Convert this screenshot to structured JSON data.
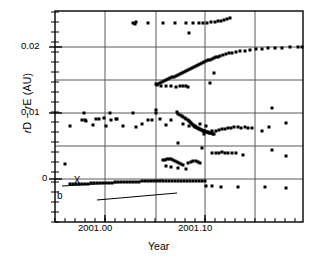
{
  "figure": {
    "type": "scatter-plot",
    "background": "#ffffff",
    "ink_color": "#000000",
    "grid_color": "#5a5a5a"
  },
  "axes": {
    "xlabel": "Year",
    "ylabel_parts": {
      "r1": "r",
      "d": "D",
      "minus": " − ",
      "r2": "r",
      "e": "E",
      "unit": " (AU)"
    },
    "ylabel_text": "rD − rE (AU)",
    "x_ticks": [
      {
        "value": 2001.0,
        "label": "2001.00",
        "px": 105
      },
      {
        "value": 2001.1,
        "label": "2001.10",
        "px": 205
      }
    ],
    "y_ticks": [
      {
        "value": 0.02,
        "label": "0.02",
        "px": 47
      },
      {
        "value": 0.01,
        "label": "0.01",
        "px": 113
      },
      {
        "value": 0.0,
        "label": "0",
        "px": 179
      }
    ],
    "x_gridlines_px": [
      105,
      156,
      205,
      255
    ],
    "y_gridlines_px": [
      47,
      80,
      113,
      146,
      179
    ],
    "minor_tick_spacing_px": 10,
    "frame_px": {
      "left": 55,
      "right": 303,
      "top": 11,
      "bottom": 222
    },
    "xlim": [
      2000.955,
      2001.203
    ],
    "ylim": [
      -0.0033,
      0.0262
    ]
  },
  "annotations": [
    {
      "name": "x-marker",
      "glyph": "X",
      "x_px": 77,
      "y_px": 180
    },
    {
      "name": "label-a",
      "text": "a",
      "x_px": 57,
      "y_px": 190
    },
    {
      "name": "label-b",
      "text": "b",
      "x_px": 99,
      "y_px": 196
    },
    {
      "name": "line-a",
      "x1_px": 62,
      "y1_px": 186,
      "x2_px": 163,
      "y2_px": 180
    },
    {
      "name": "line-b",
      "x1_px": 97,
      "y1_px": 200,
      "x2_px": 177,
      "y2_px": 193
    }
  ],
  "chart_data": {
    "type": "scatter",
    "title": "",
    "xlabel": "Year",
    "ylabel": "rD − rE (AU)",
    "xlim": [
      2000.955,
      2001.203
    ],
    "ylim": [
      -0.0033,
      0.0262
    ],
    "xticks": [
      2001.0,
      2001.1
    ],
    "xticklabels": [
      "2001.00",
      "2001.10"
    ],
    "yticks": [
      0,
      0.01,
      0.02
    ],
    "yticklabels": [
      "0",
      "0.01",
      "0.02"
    ],
    "grid": true,
    "legend": "none",
    "marker": "square",
    "marker_size_px": 3,
    "series": [
      {
        "name": "upper-track-0.0235",
        "points_px": [
          [
            133,
            23
          ],
          [
            135,
            24
          ],
          [
            136,
            22
          ],
          [
            148,
            23
          ],
          [
            163,
            23
          ],
          [
            175,
            23
          ],
          [
            186,
            23
          ],
          [
            193,
            23
          ],
          [
            199,
            23
          ],
          [
            203,
            23
          ],
          [
            207,
            23
          ],
          [
            211,
            22
          ],
          [
            215,
            22
          ],
          [
            218,
            21
          ],
          [
            221,
            21
          ],
          [
            224,
            20
          ],
          [
            227,
            19
          ],
          [
            230,
            18
          ],
          [
            189,
            33
          ]
        ]
      },
      {
        "name": "rising-track-main",
        "points_px": [
          [
            156,
            84
          ],
          [
            158,
            84
          ],
          [
            160,
            83
          ],
          [
            162,
            82
          ],
          [
            164,
            81
          ],
          [
            166,
            80
          ],
          [
            168,
            79
          ],
          [
            170,
            78
          ],
          [
            172,
            77
          ],
          [
            174,
            77
          ],
          [
            176,
            76
          ],
          [
            178,
            75
          ],
          [
            180,
            74
          ],
          [
            182,
            73
          ],
          [
            184,
            72
          ],
          [
            186,
            71
          ],
          [
            188,
            70
          ],
          [
            190,
            69
          ],
          [
            192,
            68
          ],
          [
            194,
            67
          ],
          [
            196,
            66
          ],
          [
            198,
            65
          ],
          [
            200,
            64
          ],
          [
            202,
            63
          ],
          [
            204,
            62
          ],
          [
            206,
            61
          ],
          [
            208,
            60
          ],
          [
            210,
            60
          ],
          [
            212,
            59
          ],
          [
            214,
            58
          ],
          [
            216,
            57
          ],
          [
            218,
            57
          ],
          [
            220,
            56
          ],
          [
            223,
            55
          ],
          [
            226,
            54
          ],
          [
            229,
            53
          ],
          [
            232,
            53
          ],
          [
            236,
            52
          ],
          [
            240,
            51
          ],
          [
            245,
            51
          ],
          [
            250,
            50
          ],
          [
            256,
            49
          ],
          [
            262,
            49
          ],
          [
            268,
            48
          ],
          [
            275,
            48
          ],
          [
            282,
            48
          ],
          [
            290,
            47
          ],
          [
            298,
            47
          ],
          [
            302,
            47
          ]
        ]
      },
      {
        "name": "rising-track-strays",
        "points_px": [
          [
            157,
            85
          ],
          [
            161,
            86
          ],
          [
            166,
            86
          ],
          [
            171,
            86
          ],
          [
            176,
            87
          ],
          [
            180,
            86
          ],
          [
            183,
            86
          ],
          [
            186,
            86
          ],
          [
            188,
            87
          ],
          [
            210,
            83
          ],
          [
            214,
            73
          ]
        ]
      },
      {
        "name": "mid-scatter-0.005-to-0.01",
        "points_px": [
          [
            70,
            126
          ],
          [
            84,
            113
          ],
          [
            82,
            120
          ],
          [
            85,
            120
          ],
          [
            86,
            121
          ],
          [
            93,
            125
          ],
          [
            96,
            119
          ],
          [
            99,
            119
          ],
          [
            104,
            118
          ],
          [
            106,
            126
          ],
          [
            110,
            113
          ],
          [
            111,
            120
          ],
          [
            116,
            119
          ],
          [
            117,
            119
          ],
          [
            123,
            126
          ],
          [
            133,
            113
          ],
          [
            136,
            127
          ],
          [
            142,
            124
          ],
          [
            148,
            120
          ],
          [
            152,
            120
          ],
          [
            156,
            113
          ],
          [
            156,
            110
          ],
          [
            160,
            119
          ],
          [
            166,
            125
          ],
          [
            171,
            120
          ],
          [
            177,
            112
          ],
          [
            183,
            124
          ],
          [
            189,
            126
          ],
          [
            195,
            126
          ],
          [
            200,
            124
          ],
          [
            204,
            134
          ],
          [
            206,
            126
          ],
          [
            212,
            131
          ],
          [
            216,
            131
          ],
          [
            219,
            130
          ],
          [
            222,
            129
          ],
          [
            225,
            129
          ],
          [
            228,
            128
          ],
          [
            231,
            128
          ],
          [
            234,
            127
          ],
          [
            238,
            127
          ],
          [
            241,
            128
          ],
          [
            245,
            127
          ],
          [
            248,
            128
          ],
          [
            252,
            128
          ],
          [
            272,
            108
          ],
          [
            269,
            127
          ],
          [
            262,
            131
          ],
          [
            286,
            123
          ]
        ]
      },
      {
        "name": "descending-S-track",
        "points_px": [
          [
            178,
            114
          ],
          [
            180,
            115
          ],
          [
            182,
            116
          ],
          [
            183,
            117
          ],
          [
            185,
            118
          ],
          [
            186,
            119
          ],
          [
            188,
            120
          ],
          [
            189,
            121
          ],
          [
            190,
            122
          ],
          [
            191,
            123
          ],
          [
            192,
            124
          ],
          [
            193,
            125
          ],
          [
            194,
            126
          ],
          [
            195,
            127
          ],
          [
            196,
            127
          ],
          [
            197,
            128
          ],
          [
            198,
            128
          ],
          [
            199,
            129
          ],
          [
            200,
            129
          ],
          [
            201,
            130
          ],
          [
            202,
            130
          ],
          [
            203,
            131
          ],
          [
            204,
            131
          ],
          [
            205,
            131
          ],
          [
            206,
            132
          ],
          [
            207,
            132
          ],
          [
            208,
            132
          ],
          [
            209,
            133
          ],
          [
            210,
            133
          ],
          [
            211,
            133
          ],
          [
            212,
            133
          ],
          [
            213,
            134
          ],
          [
            214,
            134
          ]
        ]
      },
      {
        "name": "low-scatter-near-0.002",
        "points_px": [
          [
            163,
            160
          ],
          [
            165,
            160
          ],
          [
            167,
            159
          ],
          [
            169,
            159
          ],
          [
            171,
            159
          ],
          [
            173,
            160
          ],
          [
            175,
            161
          ],
          [
            177,
            162
          ],
          [
            179,
            163
          ],
          [
            181,
            164
          ],
          [
            183,
            165
          ],
          [
            188,
            163
          ],
          [
            191,
            162
          ],
          [
            193,
            161
          ],
          [
            196,
            161
          ],
          [
            198,
            162
          ],
          [
            200,
            163
          ],
          [
            186,
            169
          ],
          [
            178,
            168
          ],
          [
            171,
            167
          ],
          [
            166,
            166
          ]
        ]
      },
      {
        "name": "baseline-track-near-zero",
        "points_px": [
          [
            70,
            184
          ],
          [
            73,
            184
          ],
          [
            76,
            184
          ],
          [
            79,
            184
          ],
          [
            82,
            184
          ],
          [
            85,
            184
          ],
          [
            88,
            184
          ],
          [
            91,
            183
          ],
          [
            94,
            183
          ],
          [
            97,
            183
          ],
          [
            100,
            183
          ],
          [
            103,
            183
          ],
          [
            106,
            183
          ],
          [
            109,
            183
          ],
          [
            112,
            183
          ],
          [
            115,
            182
          ],
          [
            118,
            182
          ],
          [
            121,
            182
          ],
          [
            124,
            182
          ],
          [
            127,
            182
          ],
          [
            130,
            182
          ],
          [
            133,
            182
          ],
          [
            136,
            182
          ],
          [
            139,
            182
          ],
          [
            142,
            181
          ],
          [
            145,
            181
          ],
          [
            148,
            181
          ],
          [
            151,
            181
          ],
          [
            154,
            181
          ],
          [
            157,
            181
          ],
          [
            160,
            181
          ],
          [
            163,
            181
          ],
          [
            166,
            181
          ],
          [
            169,
            181
          ],
          [
            172,
            181
          ],
          [
            175,
            181
          ],
          [
            178,
            181
          ],
          [
            181,
            181
          ],
          [
            184,
            181
          ],
          [
            187,
            181
          ],
          [
            190,
            181
          ],
          [
            193,
            181
          ],
          [
            196,
            181
          ],
          [
            199,
            181
          ],
          [
            202,
            181
          ],
          [
            205,
            181
          ]
        ]
      },
      {
        "name": "sub-zero-strays",
        "points_px": [
          [
            65,
            164
          ],
          [
            178,
            143
          ],
          [
            202,
            148
          ],
          [
            212,
            153
          ],
          [
            216,
            153
          ],
          [
            219,
            153
          ],
          [
            222,
            152
          ],
          [
            225,
            153
          ],
          [
            228,
            153
          ],
          [
            232,
            153
          ],
          [
            236,
            153
          ],
          [
            243,
            155
          ],
          [
            206,
            186
          ],
          [
            212,
            186
          ],
          [
            221,
            187
          ],
          [
            238,
            187
          ],
          [
            265,
            187
          ],
          [
            286,
            188
          ],
          [
            286,
            156
          ],
          [
            272,
            150
          ]
        ]
      }
    ]
  }
}
